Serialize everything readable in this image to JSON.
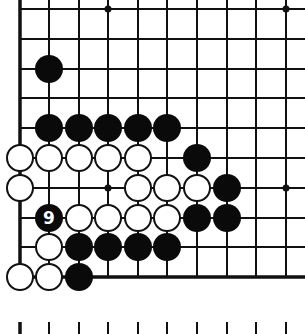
{
  "diagram": {
    "type": "go-board-fragment",
    "background": "#ffffff",
    "line_color": "#111111",
    "grid": {
      "columns_x": [
        20,
        49,
        79,
        108,
        138,
        167,
        197,
        227,
        256,
        286
      ],
      "rows_y": [
        9,
        39,
        69,
        98,
        128,
        158,
        188,
        218,
        247,
        277
      ],
      "left_edge": true,
      "bottom_edge": true,
      "right_extends_to": 305,
      "top_extends_to": 0
    },
    "star_points": [
      {
        "col": 3,
        "row": 0
      },
      {
        "col": 9,
        "row": 0
      },
      {
        "col": 3,
        "row": 6
      },
      {
        "col": 9,
        "row": 6
      }
    ],
    "stones": [
      {
        "color": "black",
        "col": 1,
        "row": 2
      },
      {
        "color": "black",
        "col": 1,
        "row": 4
      },
      {
        "color": "black",
        "col": 2,
        "row": 4
      },
      {
        "color": "black",
        "col": 3,
        "row": 4
      },
      {
        "color": "black",
        "col": 4,
        "row": 4
      },
      {
        "color": "black",
        "col": 5,
        "row": 4
      },
      {
        "color": "white",
        "col": 0,
        "row": 5
      },
      {
        "color": "white",
        "col": 1,
        "row": 5
      },
      {
        "color": "white",
        "col": 2,
        "row": 5
      },
      {
        "color": "white",
        "col": 3,
        "row": 5
      },
      {
        "color": "white",
        "col": 4,
        "row": 5
      },
      {
        "color": "black",
        "col": 6,
        "row": 5
      },
      {
        "color": "white",
        "col": 0,
        "row": 6
      },
      {
        "color": "white",
        "col": 4,
        "row": 6
      },
      {
        "color": "white",
        "col": 5,
        "row": 6
      },
      {
        "color": "white",
        "col": 6,
        "row": 6
      },
      {
        "color": "black",
        "col": 7,
        "row": 6
      },
      {
        "color": "black",
        "col": 1,
        "row": 7,
        "label": "9"
      },
      {
        "color": "white",
        "col": 2,
        "row": 7
      },
      {
        "color": "white",
        "col": 3,
        "row": 7
      },
      {
        "color": "white",
        "col": 4,
        "row": 7
      },
      {
        "color": "white",
        "col": 5,
        "row": 7
      },
      {
        "color": "black",
        "col": 6,
        "row": 7
      },
      {
        "color": "black",
        "col": 7,
        "row": 7
      },
      {
        "color": "white",
        "col": 1,
        "row": 8
      },
      {
        "color": "black",
        "col": 2,
        "row": 8
      },
      {
        "color": "black",
        "col": 3,
        "row": 8
      },
      {
        "color": "black",
        "col": 4,
        "row": 8
      },
      {
        "color": "black",
        "col": 5,
        "row": 8
      },
      {
        "color": "white",
        "col": 0,
        "row": 9
      },
      {
        "color": "white",
        "col": 1,
        "row": 9
      },
      {
        "color": "black",
        "col": 2,
        "row": 9
      }
    ],
    "bottom_tick_marks": {
      "y_top": 322,
      "y_bottom": 334
    }
  }
}
